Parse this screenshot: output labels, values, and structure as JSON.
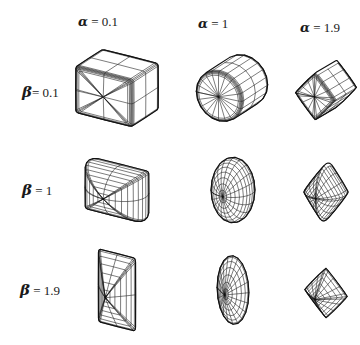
{
  "figure": {
    "title": "",
    "row_param_symbol": "β",
    "col_param_symbol": "α",
    "equals": "=",
    "width": 360,
    "height": 345,
    "line_color": "#111111",
    "background_color": "#ffffff"
  },
  "columns": [
    {
      "id": "col-alpha-0-1",
      "symbol": "α",
      "equals": "=",
      "value": "0.1",
      "label": "α  = 0.1",
      "x": 78,
      "y": 14
    },
    {
      "id": "col-alpha-1",
      "symbol": "α",
      "equals": "=",
      "value": "1",
      "label": "α  = 1",
      "x": 198,
      "y": 16
    },
    {
      "id": "col-alpha-1-9",
      "symbol": "α",
      "equals": "=",
      "value": "1.9",
      "label": "α= 1.9",
      "x": 300,
      "y": 20
    }
  ],
  "rows": [
    {
      "id": "row-beta-0-1",
      "symbol": "β",
      "equals": "=",
      "value": "0.1",
      "label": "β= 0.1",
      "x": 22,
      "y": 83
    },
    {
      "id": "row-beta-1",
      "symbol": "β",
      "equals": "=",
      "value": "1",
      "label": "β = 1",
      "x": 22,
      "y": 181
    },
    {
      "id": "row-beta-1-9",
      "symbol": "β",
      "equals": "=",
      "value": "1.9",
      "label": "β = 1.9",
      "x": 20,
      "y": 281
    }
  ],
  "chart_data": {
    "type": "scatter",
    "xlabel": "α",
    "ylabel": "β",
    "x": [
      0.1,
      1,
      1.9
    ],
    "y": [
      0.1,
      1,
      1.9
    ],
    "xlim": [
      0.1,
      1.9
    ],
    "ylim": [
      0.1,
      1.9
    ],
    "grid": false,
    "legend": "none",
    "xtick_labels": [
      "α  = 0.1",
      "α  = 1",
      "α= 1.9"
    ],
    "ytick_labels": [
      "β= 0.1",
      "β = 1",
      "β = 1.9"
    ],
    "cells": [
      {
        "alpha": 0.1,
        "beta": 0.1,
        "shape": "rounded cuboid / box",
        "row": 0,
        "col": 0
      },
      {
        "alpha": 1.0,
        "beta": 0.1,
        "shape": "barrel / rounded ellipsoid",
        "row": 0,
        "col": 1
      },
      {
        "alpha": 1.9,
        "beta": 0.1,
        "shape": "pinched star box",
        "row": 0,
        "col": 2
      },
      {
        "alpha": 0.1,
        "beta": 1.0,
        "shape": "cylinder",
        "row": 1,
        "col": 0
      },
      {
        "alpha": 1.0,
        "beta": 1.0,
        "shape": "ellipsoid",
        "row": 1,
        "col": 1
      },
      {
        "alpha": 1.9,
        "beta": 1.0,
        "shape": "pinched cone / fan",
        "row": 1,
        "col": 2
      },
      {
        "alpha": 0.1,
        "beta": 1.9,
        "shape": "pinched prism",
        "row": 2,
        "col": 0
      },
      {
        "alpha": 1.0,
        "beta": 1.9,
        "shape": "flattened ellipsoid / lens",
        "row": 2,
        "col": 1
      },
      {
        "alpha": 1.9,
        "beta": 1.9,
        "shape": "pinched double cone / star",
        "row": 2,
        "col": 2
      }
    ]
  },
  "shapes": [
    {
      "id": "shape-a0.1-b0.1",
      "alpha": 0.1,
      "beta": 0.1,
      "name": "rounded-cuboid",
      "x": 62,
      "y": 38,
      "w": 110,
      "h": 100,
      "rx": 34,
      "ry": 26,
      "rz": 26,
      "yaw": -32,
      "pitch": 24,
      "roll": 0,
      "scale": 1.0
    },
    {
      "id": "shape-a1-b0.1",
      "alpha": 1.0,
      "beta": 0.1,
      "name": "barrel-ellipsoid",
      "x": 186,
      "y": 38,
      "w": 92,
      "h": 100,
      "rx": 27,
      "ry": 27,
      "rz": 27,
      "yaw": -30,
      "pitch": 22,
      "roll": 0,
      "scale": 1.0
    },
    {
      "id": "shape-a1.9-b0.1",
      "alpha": 1.9,
      "beta": 0.1,
      "name": "pinched-star-box",
      "x": 292,
      "y": 42,
      "w": 68,
      "h": 96,
      "rx": 23,
      "ry": 25,
      "rz": 23,
      "yaw": -30,
      "pitch": 20,
      "roll": 0,
      "scale": 1.0
    },
    {
      "id": "shape-a0.1-b1",
      "alpha": 0.1,
      "beta": 1.0,
      "name": "cylinder",
      "x": 62,
      "y": 140,
      "w": 110,
      "h": 100,
      "rx": 34,
      "ry": 26,
      "rz": 26,
      "yaw": -32,
      "pitch": 24,
      "roll": 0,
      "scale": 1.0
    },
    {
      "id": "shape-a1-b1",
      "alpha": 1.0,
      "beta": 1.0,
      "name": "ellipsoid",
      "x": 188,
      "y": 140,
      "w": 90,
      "h": 100,
      "rx": 22,
      "ry": 34,
      "rz": 22,
      "yaw": -28,
      "pitch": 20,
      "roll": 0,
      "scale": 1.0
    },
    {
      "id": "shape-a1.9-b1",
      "alpha": 1.9,
      "beta": 1.0,
      "name": "pinched-cone",
      "x": 292,
      "y": 144,
      "w": 68,
      "h": 96,
      "rx": 22,
      "ry": 30,
      "rz": 22,
      "yaw": -28,
      "pitch": 20,
      "roll": 0,
      "scale": 1.0
    },
    {
      "id": "shape-a0.1-b1.9",
      "alpha": 0.1,
      "beta": 1.9,
      "name": "pinched-prism",
      "x": 62,
      "y": 240,
      "w": 110,
      "h": 100,
      "rx": 22,
      "ry": 40,
      "rz": 22,
      "yaw": -32,
      "pitch": 24,
      "roll": 0,
      "scale": 1.0
    },
    {
      "id": "shape-a1-b1.9",
      "alpha": 1.0,
      "beta": 1.9,
      "name": "flattened-ellipsoid",
      "x": 188,
      "y": 240,
      "w": 90,
      "h": 100,
      "rx": 18,
      "ry": 36,
      "rz": 18,
      "yaw": -28,
      "pitch": 18,
      "roll": 0,
      "scale": 1.0
    },
    {
      "id": "shape-a1.9-b1.9",
      "alpha": 1.9,
      "beta": 1.9,
      "name": "pinched-double-cone",
      "x": 292,
      "y": 246,
      "w": 68,
      "h": 94,
      "rx": 24,
      "ry": 26,
      "rz": 24,
      "yaw": -28,
      "pitch": 18,
      "roll": 0,
      "scale": 1.0
    }
  ]
}
